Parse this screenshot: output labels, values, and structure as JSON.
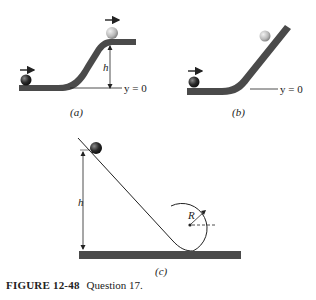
{
  "figure": {
    "number_label": "FIGURE 12-48",
    "caption": "Question 17."
  },
  "panels": [
    {
      "id": "a",
      "label": "(a)",
      "height_label": "h",
      "baseline_label": "y = 0"
    },
    {
      "id": "b",
      "label": "(b)",
      "baseline_label": "y = 0"
    },
    {
      "id": "c",
      "label": "(c)",
      "height_label": "h",
      "radius_label": "R"
    }
  ],
  "colors": {
    "track": "#4a4a4a",
    "ball_dark": "#2a2a2a",
    "ball_light": "#bdbdbd",
    "line": "#222222"
  }
}
